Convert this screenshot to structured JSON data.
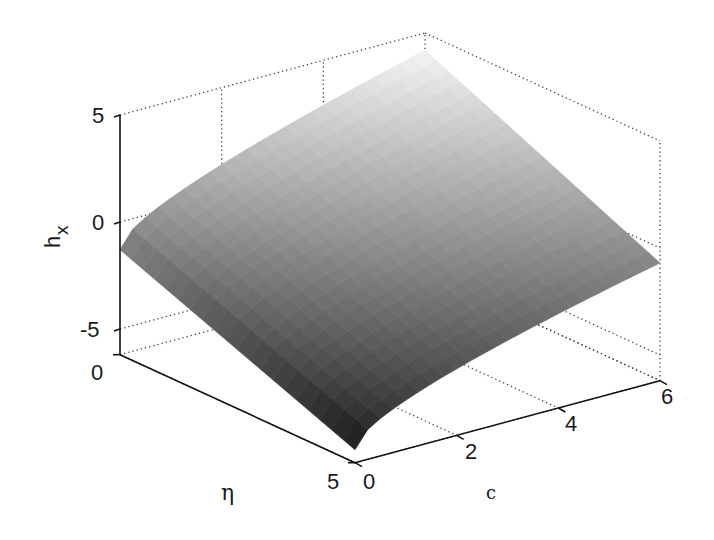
{
  "chart_data": {
    "type": "surface3d",
    "title": "",
    "xlabel": "c",
    "ylabel": "η",
    "zlabel": "h",
    "zlabel_subscript": "x",
    "x_axis": {
      "name": "c",
      "range": [
        0,
        6
      ],
      "ticks": [
        0,
        2,
        4,
        6
      ]
    },
    "y_axis": {
      "name": "η",
      "range": [
        0,
        5
      ],
      "ticks": [
        0,
        5
      ]
    },
    "z_axis": {
      "name": "h_x",
      "range": [
        -6.2,
        5
      ],
      "ticks": [
        -5,
        0,
        5
      ]
    },
    "grid": true,
    "grid_style": "dotted",
    "colormap": "gray",
    "surface_corners": [
      {
        "c": 0,
        "eta": 0,
        "h": -1.3
      },
      {
        "c": 6,
        "eta": 0,
        "h": 4.2
      },
      {
        "c": 6,
        "eta": 5,
        "h": -0.2
      },
      {
        "c": 0,
        "eta": 5,
        "h": -5.6
      }
    ]
  },
  "labels": {
    "z_ticks": [
      "5",
      "0",
      "-5"
    ],
    "eta_ticks": [
      "0",
      "5"
    ],
    "c_ticks": [
      "0",
      "2",
      "4",
      "6"
    ],
    "z_label_main": "h",
    "z_label_sub": "x",
    "eta_label": "η",
    "c_label": "c"
  }
}
